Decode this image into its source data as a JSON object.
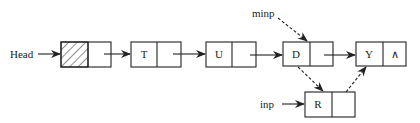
{
  "diagram": {
    "type": "linked-list-insertion",
    "labels": {
      "head": "Head",
      "minp": "minp",
      "inp": "inp"
    },
    "nodes": [
      {
        "id": "head",
        "data": "",
        "hatched": true
      },
      {
        "id": "t",
        "data": "T"
      },
      {
        "id": "u",
        "data": "U"
      },
      {
        "id": "d",
        "data": "D"
      },
      {
        "id": "y",
        "data": "Y",
        "next": "∧"
      },
      {
        "id": "r",
        "data": "R"
      }
    ],
    "edges": [
      {
        "from": "Head",
        "to": "head",
        "style": "solid"
      },
      {
        "from": "head",
        "to": "t",
        "style": "solid"
      },
      {
        "from": "t",
        "to": "u",
        "style": "solid"
      },
      {
        "from": "u",
        "to": "d",
        "style": "solid"
      },
      {
        "from": "d",
        "to": "y",
        "style": "solid"
      },
      {
        "from": "minp",
        "to": "d",
        "style": "dashed"
      },
      {
        "from": "d",
        "to": "r",
        "style": "dashed"
      },
      {
        "from": "r",
        "to": "y",
        "style": "dashed"
      },
      {
        "from": "inp",
        "to": "r",
        "style": "solid"
      }
    ]
  }
}
